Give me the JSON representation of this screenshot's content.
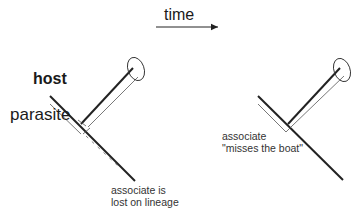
{
  "labels": {
    "time": "time",
    "host": "host",
    "parasite": "parasite",
    "left_note_line1": "associate is",
    "left_note_line2": "lost on lineage",
    "right_note_line1": "associate",
    "right_note_line2": "\"misses the boat\""
  },
  "colors": {
    "line": "#222222",
    "thin_line": "#555555",
    "background": "#ffffff"
  },
  "panels": [
    {
      "name": "left",
      "scenario": "associate is lost on lineage"
    },
    {
      "name": "right",
      "scenario": "associate misses the boat"
    }
  ]
}
